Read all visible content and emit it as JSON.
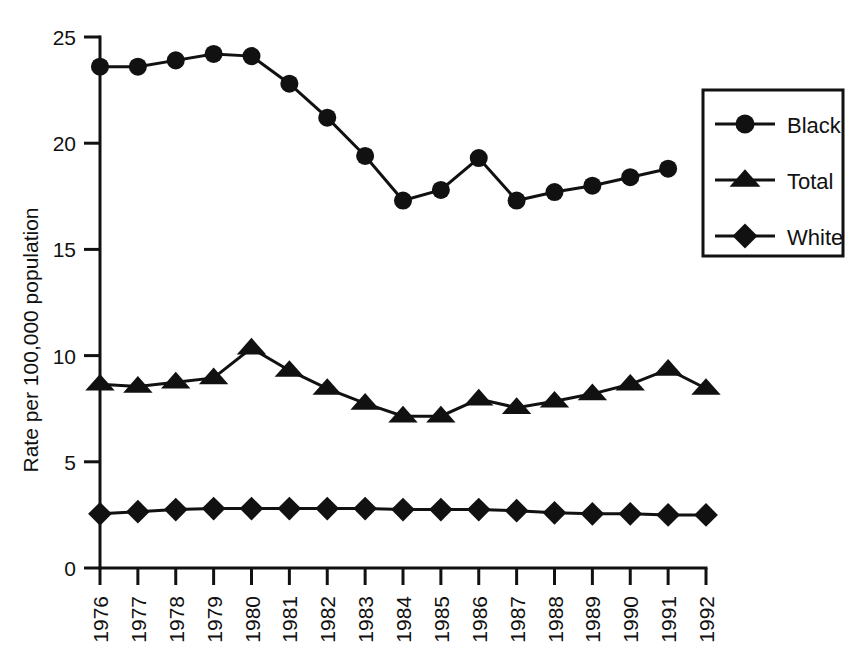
{
  "chart_data": {
    "type": "line",
    "title": "",
    "xlabel": "",
    "ylabel": "Rate per 100,000 population",
    "categories": [
      "1976",
      "1977",
      "1978",
      "1979",
      "1980",
      "1981",
      "1982",
      "1983",
      "1984",
      "1985",
      "1986",
      "1987",
      "1988",
      "1989",
      "1990",
      "1991",
      "1992"
    ],
    "xlim": [
      "1976",
      "1992"
    ],
    "ylim": [
      0,
      25
    ],
    "yticks": [
      0,
      5,
      10,
      15,
      20,
      25
    ],
    "ytick_labels": [
      "0",
      "5",
      "10",
      "15",
      "20",
      "25"
    ],
    "grid": false,
    "legend_position": "upper-right-outside",
    "series": [
      {
        "name": "Black",
        "marker": "circle",
        "color": "#111111",
        "values": [
          23.6,
          23.6,
          23.9,
          24.2,
          24.1,
          22.8,
          21.2,
          19.4,
          17.3,
          17.8,
          19.3,
          17.3,
          17.7,
          18.0,
          18.4,
          18.8,
          null
        ]
      },
      {
        "name": "Total",
        "marker": "triangle",
        "color": "#111111",
        "values": [
          8.65,
          8.55,
          8.75,
          8.95,
          10.35,
          9.3,
          8.45,
          7.75,
          7.15,
          7.15,
          7.95,
          7.55,
          7.85,
          8.2,
          8.65,
          9.35,
          8.45
        ]
      },
      {
        "name": "White",
        "marker": "diamond",
        "color": "#111111",
        "values": [
          2.55,
          2.65,
          2.75,
          2.8,
          2.8,
          2.8,
          2.8,
          2.8,
          2.75,
          2.75,
          2.75,
          2.7,
          2.6,
          2.55,
          2.55,
          2.5,
          2.5
        ]
      }
    ],
    "legend_entries": [
      {
        "label": "Black",
        "marker": "circle"
      },
      {
        "label": "Total",
        "marker": "triangle"
      },
      {
        "label": "White",
        "marker": "diamond"
      }
    ]
  }
}
